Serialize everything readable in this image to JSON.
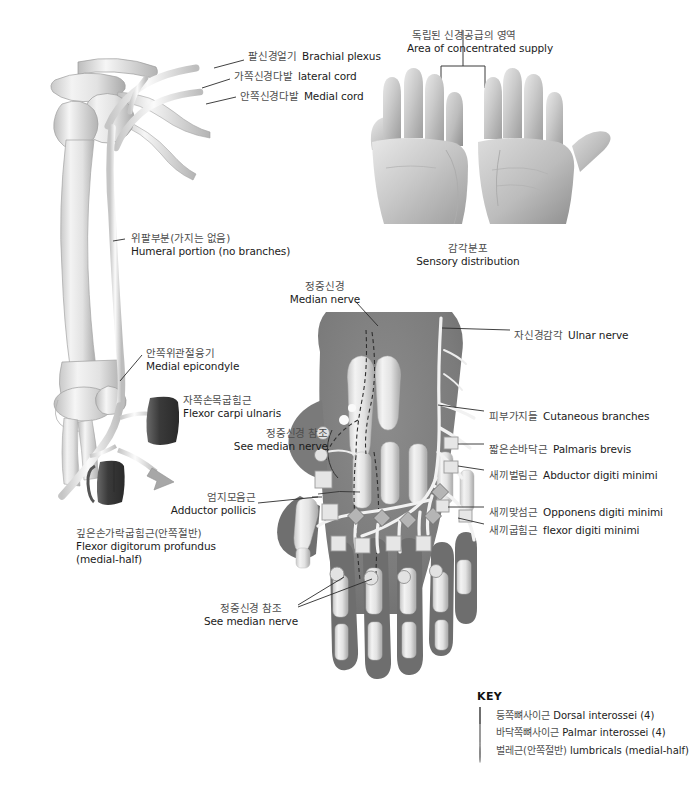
{
  "figure": {
    "title_ko": "자신경 (Ulnar nerve)",
    "title_en": "Ulnar nerve distribution"
  },
  "arm_panel": {
    "labels": [
      {
        "id": "brachial-plexus",
        "ko": "팔신경얼기",
        "en": "Brachial plexus"
      },
      {
        "id": "lateral-cord",
        "ko": "가쪽신경다발",
        "en": "lateral cord"
      },
      {
        "id": "medial-cord",
        "ko": "안쪽신경다발",
        "en": "Medial cord"
      },
      {
        "id": "humeral-portion",
        "ko": "위팔부분(가지는 없음)",
        "en": "Humeral portion (no branches)"
      },
      {
        "id": "medial-epicondyle",
        "ko": "안쪽위관절융기",
        "en": "Medial epicondyle"
      },
      {
        "id": "flexor-carpi-ulnaris",
        "ko": "자쪽손목굽힘근",
        "en": "Flexor carpi ulnaris"
      },
      {
        "id": "flexor-digitorum-profundus",
        "ko": "깊은손가락굽힘근(안쪽절반)",
        "en": "Flexor digitorum profundus",
        "en2": "(medial-half)"
      }
    ]
  },
  "hands_panel": {
    "top_ko": "독립된 신경공급의 영역",
    "top_en": "Area of concentrated supply",
    "caption_ko": "감각분포",
    "caption_en": "Sensory distribution"
  },
  "hand_panel": {
    "labels": [
      {
        "id": "median-nerve",
        "ko": "정중신경",
        "en": "Median nerve"
      },
      {
        "id": "ulnar-nerve",
        "ko": "자신경감각",
        "en": "Ulnar nerve"
      },
      {
        "id": "cutaneous-branches",
        "ko": "피부가지들",
        "en": "Cutaneous branches"
      },
      {
        "id": "palmaris-brevis",
        "ko": "짧은손바닥근",
        "en": "Palmaris brevis"
      },
      {
        "id": "abductor-digiti-minimi",
        "ko": "새끼벌림근",
        "en": "Abductor digiti minimi"
      },
      {
        "id": "opponens-digiti-minimi",
        "ko": "새끼맞섬근",
        "en": "Opponens digiti minimi"
      },
      {
        "id": "flexor-digiti-minimi",
        "ko": "새끼굽힘근",
        "en": "flexor digiti minimi"
      },
      {
        "id": "see-median-nerve-upper",
        "ko": "정중신경 참조",
        "en": "See median nerve"
      },
      {
        "id": "adductor-pollicis",
        "ko": "엄지모음근",
        "en": "Adductor pollicis"
      },
      {
        "id": "see-median-nerve-lower",
        "ko": "정중신경 참조",
        "en": "See median nerve"
      }
    ]
  },
  "legend": {
    "title": "KEY",
    "items": [
      {
        "marker": "diamond-marker",
        "ko": "등쪽뼈사이근",
        "en": "Dorsal interossei (4)"
      },
      {
        "marker": "square-marker",
        "ko": "바닥쪽뼈사이근",
        "en": "Palmar interossei (4)"
      },
      {
        "marker": "circle-marker",
        "ko": "벌레근(안쪽절반)",
        "en": "lumbricals (medial-half)"
      }
    ]
  },
  "colors": {
    "background": "#ffffff",
    "korean_label": "#4d4d4d",
    "english_label": "#1b1b1b",
    "leader_line": "#2b2b2b",
    "hand_fill": "#7d7d7d",
    "bone_fill": "#efefef",
    "nerve_fill": "#fafafa",
    "muscle_block": "#3a3a3a"
  }
}
